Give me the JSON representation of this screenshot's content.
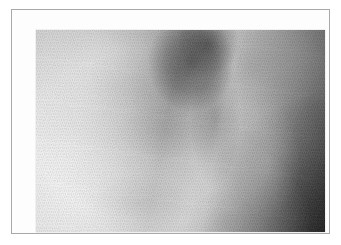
{
  "page": {
    "background_color": "#ffffff",
    "width": 341,
    "height": 245
  },
  "frame": {
    "border_color": "#a9a9ab",
    "border_width_px": 1,
    "mat_color": "#fdfdfd",
    "mat_inset_px": 11,
    "bounds": {
      "left": 11,
      "top": 9,
      "width": 319,
      "height": 225
    }
  },
  "photo": {
    "alt_text": "Grayscale close-up texture photograph of fibrous material",
    "bounds": {
      "left": 24,
      "top": 20,
      "width": 289,
      "height": 202
    },
    "color_mode": "grayscale",
    "tone": {
      "brightest_region": "lower-left",
      "brightest_value": 242,
      "darkest_region": "lower-right-corner",
      "darkest_value": 30,
      "mean_value": 165
    },
    "features": [
      {
        "name": "bright-field-left",
        "description": "Light, nearly white fibrous field occupying the left third",
        "gray_value": 232
      },
      {
        "name": "dark-blotch-upper-center",
        "description": "Diffuse dark smudge in the upper-middle of the frame",
        "gray_value": 92
      },
      {
        "name": "dark-vertical-band",
        "description": "Vertical darker band running down the centre-right",
        "gray_value": 118
      },
      {
        "name": "bright-band-right-of-centre",
        "description": "Lighter vertical band just right of the dark band",
        "gray_value": 196
      },
      {
        "name": "dark-corner-lower-right",
        "description": "Near-black shadowed corner at the lower right",
        "gray_value": 34
      },
      {
        "name": "diagonal-fibre-grain",
        "description": "Fine diagonal weave/fibre grain across the whole surface",
        "angle_degrees": 108
      }
    ]
  }
}
